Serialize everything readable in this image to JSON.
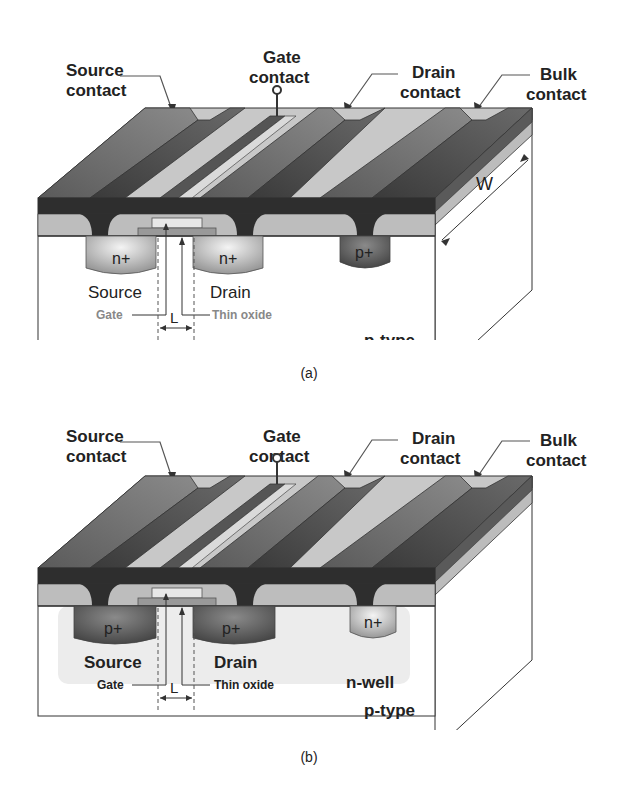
{
  "figures": [
    {
      "id": "a",
      "caption": "(a)",
      "device": "nmos",
      "labels": {
        "source_contact": [
          "Source",
          "contact"
        ],
        "gate_contact": [
          "Gate",
          "contact"
        ],
        "drain_contact": [
          "Drain",
          "contact"
        ],
        "bulk_contact": [
          "Bulk",
          "contact"
        ],
        "source_region": "n+",
        "drain_region": "n+",
        "bulk_region": "p+",
        "source": "Source",
        "drain": "Drain",
        "gate": "Gate",
        "thin_oxide": "Thin oxide",
        "length": "L",
        "width": "W",
        "substrate": "p-type",
        "well": ""
      }
    },
    {
      "id": "b",
      "caption": "(b)",
      "device": "pmos",
      "labels": {
        "source_contact": [
          "Source",
          "contact"
        ],
        "gate_contact": [
          "Gate",
          "contact"
        ],
        "drain_contact": [
          "Drain",
          "contact"
        ],
        "bulk_contact": [
          "Bulk",
          "contact"
        ],
        "source_region": "p+",
        "drain_region": "p+",
        "bulk_region": "n+",
        "source": "Source",
        "drain": "Drain",
        "gate": "Gate",
        "thin_oxide": "Thin oxide",
        "length": "L",
        "substrate": "p-type",
        "well": "n-well"
      }
    }
  ],
  "colors": {
    "metal_top": "#7a7a7a",
    "metal_dark": "#3a3a3a",
    "oxide": "#bdbdbd",
    "light_strip": "#d6d6d6",
    "substrate": "#ffffff",
    "nwell": "#ececec",
    "outline": "#333333"
  }
}
